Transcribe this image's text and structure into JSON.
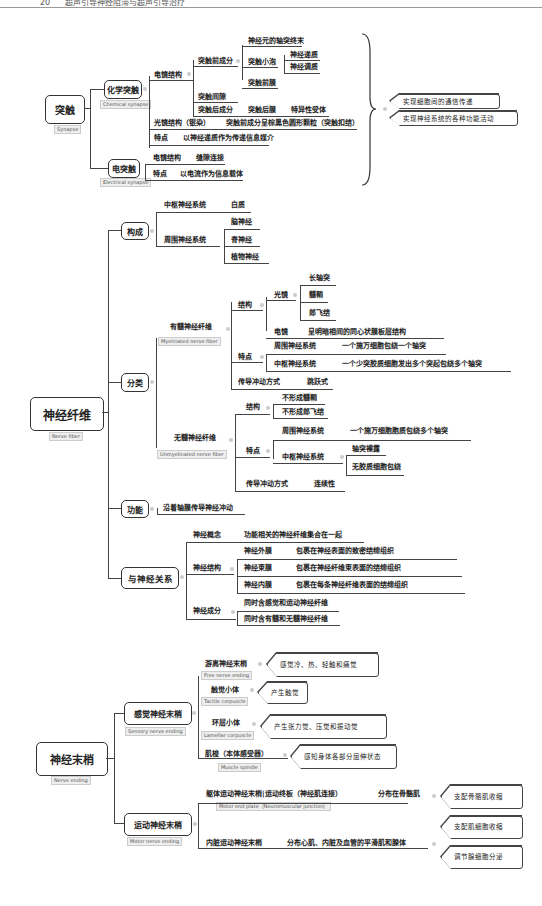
{
  "header": {
    "page_number": "20",
    "title": "超声引导神经阻滞与超声引导治疗"
  },
  "synapse": {
    "root": "突触",
    "root_en": "Synapse",
    "chemical": {
      "label": "化学突触",
      "en": "Chemical synapse",
      "em_structure": "电镜结构",
      "presynaptic": "突触前成分",
      "axon_terminal": "神经元的轴突终末",
      "vesicle": "突触小泡",
      "neurotransmitter": "神经递质",
      "neuromodulator": "神经调质",
      "presynaptic_membrane": "突触前膜",
      "cleft": "突触间隙",
      "postsynaptic": "突触后成分",
      "postsynaptic_membrane": "突触后膜",
      "receptor": "特异性受体",
      "lm_structure": "光镜结构（银染）",
      "lm_desc": "突触前成分呈棕黑色圆形颗粒（突触扣结）",
      "feature": "特点",
      "feature_desc": "以神经递质作为传递信息媒介"
    },
    "electrical": {
      "label": "电突触",
      "en": "Electrical synapse",
      "em_structure": "电镜结构",
      "em_desc": "缝隙连接",
      "feature": "特点",
      "feature_desc": "以电流作为信息载体"
    },
    "functions": [
      "实现细胞间的通信传递",
      "实现神经系统的各种功能活动"
    ]
  },
  "nerve_fiber": {
    "root": "神经纤维",
    "root_en": "Nerve fiber",
    "composition": {
      "label": "构成",
      "cns": "中枢神经系统",
      "cns_desc": "白质",
      "pns": "周围神经系统",
      "pns_items": [
        "脑神经",
        "脊神经",
        "植物神经"
      ]
    },
    "classification": {
      "label": "分类",
      "myelinated": {
        "label": "有髓神经纤维",
        "en": "Myelinated nerve fiber",
        "structure": "结构",
        "lm": "光镜",
        "lm_items": [
          "长轴突",
          "髓鞘",
          "郎飞结"
        ],
        "em": "电镜",
        "em_desc": "呈明暗相间的同心状膜板层结构",
        "feature": "特点",
        "pns": "周围神经系统",
        "pns_desc": "一个施万细胞包绕一个轴突",
        "cns": "中枢神经系统",
        "cns_desc": "一个少突胶质细胞发出多个突起包绕多个轴突",
        "conduction": "传导冲动方式",
        "conduction_desc": "跳跃式"
      },
      "unmyelinated": {
        "label": "无髓神经纤维",
        "en": "Unmyelinated nerve fiber",
        "structure": "结构",
        "structure_items": [
          "不形成髓鞘",
          "不形成郎飞结"
        ],
        "feature": "特点",
        "pns": "周围神经系统",
        "pns_desc": "一个施万细胞胞质包绕多个轴突",
        "cns": "中枢神经系统",
        "cns_items": [
          "轴突裸露",
          "无胶质细胞包绕"
        ],
        "conduction": "传导冲动方式",
        "conduction_desc": "连续性"
      }
    },
    "function": {
      "label": "功能",
      "desc": "沿着轴膜传导神经冲动"
    },
    "nerve_relation": {
      "label": "与神经关系",
      "concept": "神经概念",
      "concept_desc": "功能相关的神经纤维集合在一起",
      "structure": "神经结构",
      "structure_items": [
        {
          "name": "神经外膜",
          "desc": "包裹在神经表面的致密结缔组织"
        },
        {
          "name": "神经束膜",
          "desc": "包裹在神经纤维束表面的结缔组织"
        },
        {
          "name": "神经内膜",
          "desc": "包裹在每条神经纤维表面的结缔组织"
        }
      ],
      "components": "神经成分",
      "components_items": [
        "同时含感觉和运动神经纤维",
        "同时含有髓和无髓神经纤维"
      ]
    }
  },
  "nerve_ending": {
    "root": "神经末梢",
    "root_en": "Nerve ending",
    "sensory": {
      "label": "感觉神经末梢",
      "en": "Sensory nerve ending",
      "items": [
        {
          "name": "游离神经末梢",
          "en": "Free nerve ending",
          "desc": "感觉冷、热、轻触和痛觉"
        },
        {
          "name": "触觉小体",
          "en": "Tactile corpuscle",
          "desc": "产生触觉"
        },
        {
          "name": "环层小体",
          "en": "Lamellar corpuscle",
          "desc": "产生张力觉、压觉和振动觉"
        },
        {
          "name": "肌梭（本体感受器）",
          "en": "Muscle spindle",
          "desc": "感知身体各部分屈伸状态"
        }
      ]
    },
    "motor": {
      "label": "运动神经末梢",
      "en": "Motor nerve ending",
      "somatic": "躯体运动神经末梢|运动终板（神经肌连接）",
      "somatic_en": "Motor end plate（Neuromuscular junction）",
      "somatic_dist": "分布在骨骼肌",
      "somatic_func": "支配骨骼肌收缩",
      "visceral": "内脏运动神经末梢",
      "visceral_dist": "分布心肌、内脏及血管的平滑肌和腺体",
      "visceral_funcs": [
        "支配肌细胞收缩",
        "调节腺细胞分泌"
      ]
    }
  }
}
